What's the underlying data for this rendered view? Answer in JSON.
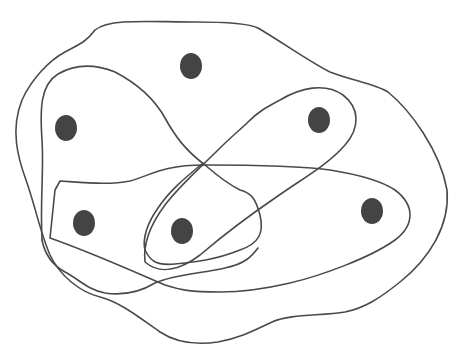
{
  "diagram": {
    "type": "hypergraph",
    "colors": {
      "background": "#ffffff",
      "stroke": "#4a4a4a",
      "vertex_fill": "#444444"
    },
    "vertices": [
      {
        "id": "v1",
        "cx": 191,
        "cy": 66,
        "rx": 11,
        "ry": 13
      },
      {
        "id": "v2",
        "cx": 66,
        "cy": 128,
        "rx": 11,
        "ry": 13
      },
      {
        "id": "v3",
        "cx": 319,
        "cy": 120,
        "rx": 11,
        "ry": 13
      },
      {
        "id": "v4",
        "cx": 84,
        "cy": 223,
        "rx": 11,
        "ry": 13
      },
      {
        "id": "v5",
        "cx": 182,
        "cy": 231,
        "rx": 11,
        "ry": 13
      },
      {
        "id": "v6",
        "cx": 372,
        "cy": 211,
        "rx": 11,
        "ry": 13
      }
    ],
    "hyperedges": [
      {
        "id": "e-outer",
        "contains": [
          "v1",
          "v2",
          "v3",
          "v4",
          "v5",
          "v6"
        ],
        "path": "M 95 30 C 110 18, 150 22, 195 22 C 225 22, 250 24, 258 28 C 285 44, 310 62, 330 72 C 350 80, 375 84, 388 92 C 410 110, 440 150, 447 190 C 450 225, 430 258, 400 282 C 380 298, 365 308, 345 312 C 320 316, 290 314, 272 322 C 255 330, 240 338, 218 342 C 190 346, 172 340, 160 332 C 140 318, 120 302, 100 297 C 80 292, 60 276, 50 255 C 40 232, 35 205, 26 180 C 18 158, 10 130, 22 100 C 32 78, 50 60, 65 52 C 80 44, 86 42, 95 30 Z"
      },
      {
        "id": "e-left",
        "contains": [
          "v2",
          "v5"
        ],
        "path": "M 42 240 C 40 200, 44 170, 42 140 C 40 110, 40 85, 58 74 C 75 64, 95 64, 115 72 C 140 85, 155 100, 165 118 C 175 136, 185 150, 205 165 C 220 178, 230 185, 240 190 C 252 193, 256 200, 260 215 C 264 232, 260 243, 240 250 C 215 260, 195 262, 175 264 C 155 266, 150 260, 145 250 C 142 238, 148 222, 158 208 C 170 190, 185 178, 203 163"
      },
      {
        "id": "e-upper-right",
        "contains": [
          "v3",
          "v5"
        ],
        "path": "M 145 262 C 143 245, 150 225, 165 205 C 180 185, 200 168, 218 150 C 232 136, 240 130, 248 122 C 258 112, 265 108, 280 100 C 300 88, 325 82, 343 95 C 360 108, 360 128, 345 145 C 328 165, 300 180, 275 198 C 250 215, 220 238, 200 255 C 180 270, 160 275, 145 262 Z"
      },
      {
        "id": "e-bottom",
        "contains": [
          "v4",
          "v6"
        ],
        "path": "M 60 181 C 90 183, 110 185, 130 181 C 150 176, 160 165, 205 165 C 260 165, 300 166, 330 170 C 355 174, 380 180, 395 190 C 415 205, 415 225, 395 240 C 370 258, 320 276, 290 283 C 260 290, 240 292, 220 292 C 190 292, 180 290, 165 285 C 130 270, 90 252, 50 238 L 55 190 Z"
      },
      {
        "id": "e-left-bottom",
        "contains": [
          "v2",
          "v4"
        ],
        "path": "M 42 240 C 45 255, 52 265, 65 272 C 80 280, 88 290, 105 293 C 125 296, 140 292, 155 283 C 175 274, 205 273, 225 268 C 245 264, 252 256, 258 248"
      }
    ]
  }
}
